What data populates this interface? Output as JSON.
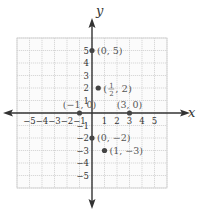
{
  "chart_data": {
    "type": "scatter",
    "title": "",
    "xlabel": "x",
    "ylabel": "y",
    "xlim": [
      -6,
      6
    ],
    "ylim": [
      -6,
      6
    ],
    "grid": true,
    "x_ticks": [
      -5,
      -4,
      -3,
      -2,
      -1,
      1,
      2,
      3,
      4,
      5
    ],
    "y_ticks": [
      5,
      4,
      3,
      2,
      1,
      -1,
      -2,
      -3,
      -4,
      -5
    ],
    "x_tick_labels": [
      "−5",
      "−4",
      "−3",
      "−2",
      "−1",
      "1",
      "2",
      "3",
      "4",
      "5"
    ],
    "y_tick_labels": [
      "5",
      "4",
      "3",
      "2",
      "1",
      "−1",
      "−2",
      "−3",
      "−4",
      "−5"
    ],
    "points": [
      {
        "x": 0,
        "y": 5,
        "label": "(0, 5)"
      },
      {
        "x": 0.5,
        "y": 2,
        "label": "(1/2, 2)"
      },
      {
        "x": -1,
        "y": 0,
        "label": "(−1, 0)"
      },
      {
        "x": 3,
        "y": 0,
        "label": "(3, 0)"
      },
      {
        "x": 0,
        "y": -2,
        "label": "(0, −2)"
      },
      {
        "x": 1,
        "y": -3,
        "label": "(1, −3)"
      }
    ],
    "colors": {
      "axis": "#333333",
      "grid": "#cfcfcf",
      "point": "#444444",
      "label": "#555555"
    }
  }
}
